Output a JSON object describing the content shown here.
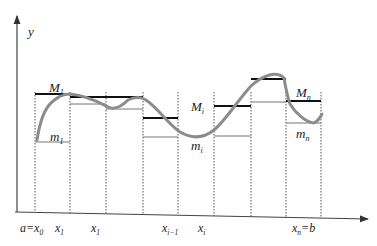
{
  "diagram": {
    "y_axis_label": "y",
    "x_tick_labels": [
      {
        "main": "a=x",
        "sub": "0",
        "x": 32
      },
      {
        "main": "x",
        "sub": "1",
        "x": 67
      },
      {
        "main": "x",
        "sub": "1",
        "x": 103
      },
      {
        "main": "x",
        "sub": "i−1",
        "x": 174
      },
      {
        "main": "x",
        "sub": "i",
        "x": 210
      },
      {
        "main": "x",
        "sub": "n",
        "x": 304,
        "suffix": "=b"
      }
    ],
    "annotations": [
      {
        "main": "M",
        "sub": "1",
        "x": 49,
        "y": 92
      },
      {
        "main": "m",
        "sub": "1",
        "x": 50,
        "y": 141
      },
      {
        "main": "M",
        "sub": "i",
        "x": 191,
        "y": 111
      },
      {
        "main": "m",
        "sub": "i",
        "x": 191,
        "y": 150
      },
      {
        "main": "M",
        "sub": "n",
        "x": 296,
        "y": 97
      },
      {
        "main": "m",
        "sub": "n",
        "x": 296,
        "y": 138
      }
    ],
    "partition_x": [
      35,
      70,
      106,
      143,
      178,
      214,
      251,
      286,
      321
    ],
    "upper_values": [
      94,
      97,
      97,
      118,
      106,
      79,
      101
    ],
    "lower_values": [
      142,
      104,
      109,
      137,
      136,
      102,
      123
    ],
    "colors": {
      "axis": "#444444",
      "curve": "#8c8c8c",
      "upper": "#111111",
      "lower": "#777777",
      "partition": "#555555"
    }
  }
}
